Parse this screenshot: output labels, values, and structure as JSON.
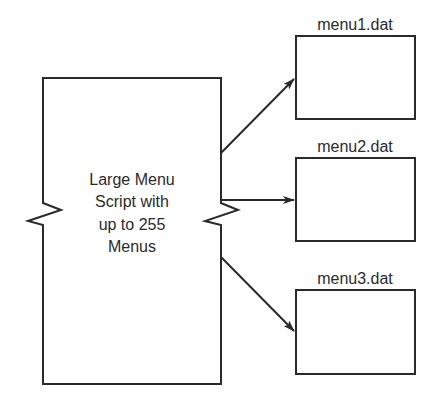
{
  "diagram": {
    "source_box": {
      "lines": [
        "Large Menu",
        "Script with",
        "up to 255",
        "Menus"
      ]
    },
    "targets": [
      {
        "label": "menu1.dat"
      },
      {
        "label": "menu2.dat"
      },
      {
        "label": "menu3.dat"
      }
    ],
    "colors": {
      "line": "#2a2a2a",
      "text": "#2b2b2b",
      "background": "#ffffff"
    }
  }
}
